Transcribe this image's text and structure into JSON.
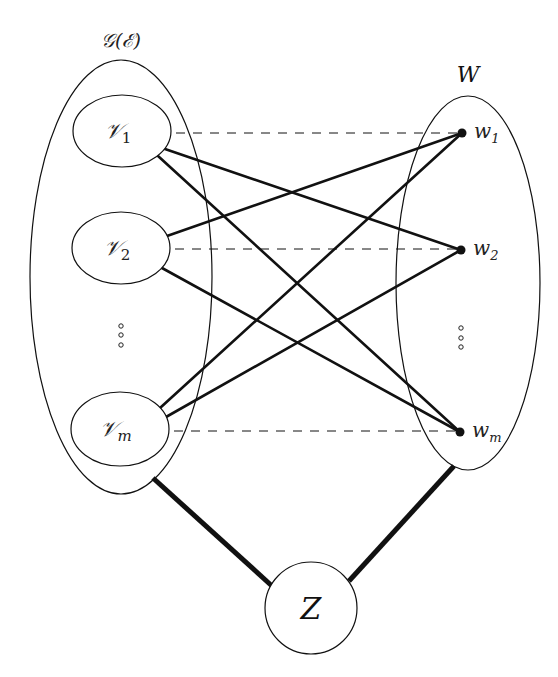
{
  "figure": {
    "width": 558,
    "height": 677,
    "colors": {
      "background": "#ffffff",
      "stroke": "#111111"
    }
  },
  "labels": {
    "left_set": "𝒢(ℰ)",
    "right_set": "W",
    "hub": "Z"
  },
  "left_group": {
    "label": "𝒢(ℰ)",
    "ellipse": {
      "cx": 121,
      "cy": 277,
      "rx": 91,
      "ry": 217
    },
    "nodes": [
      {
        "id": "v1",
        "symbol": "𝒱",
        "subscript": "1",
        "cx": 122,
        "cy": 131,
        "rx": 49,
        "ry": 36
      },
      {
        "id": "v2",
        "symbol": "𝒱",
        "subscript": "2",
        "cx": 121,
        "cy": 248,
        "rx": 49,
        "ry": 36
      },
      {
        "id": "vm",
        "symbol": "𝒱",
        "subscript": "m",
        "cx": 120,
        "cy": 429,
        "rx": 49,
        "ry": 37
      }
    ],
    "ellipsis": "⋮"
  },
  "right_group": {
    "label": "W",
    "ellipse": {
      "cx": 468,
      "cy": 283,
      "rx": 72,
      "ry": 187
    },
    "nodes": [
      {
        "id": "w1",
        "symbol": "w",
        "subscript": "1",
        "x": 462,
        "y": 133
      },
      {
        "id": "w2",
        "symbol": "w",
        "subscript": "2",
        "x": 461,
        "y": 250
      },
      {
        "id": "wm",
        "symbol": "w",
        "subscript": "m",
        "x": 460,
        "y": 432
      }
    ],
    "ellipsis": "⋮"
  },
  "hub": {
    "label": "Z",
    "cx": 311,
    "cy": 608,
    "r": 46
  },
  "edges": {
    "dashed": [
      {
        "from": "v1",
        "to": "w1",
        "x1": 176,
        "y1": 133,
        "x2": 458,
        "y2": 133
      },
      {
        "from": "v2",
        "to": "w2",
        "x1": 175,
        "y1": 249,
        "x2": 457,
        "y2": 249
      },
      {
        "from": "vm",
        "to": "wm",
        "x1": 174,
        "y1": 431,
        "x2": 456,
        "y2": 431
      }
    ],
    "solid": [
      {
        "from": "v1",
        "to": "w2",
        "x1": 165,
        "y1": 149,
        "x2": 461,
        "y2": 250
      },
      {
        "from": "v1",
        "to": "wm",
        "x1": 158,
        "y1": 156,
        "x2": 460,
        "y2": 432
      },
      {
        "from": "v2",
        "to": "w1",
        "x1": 167,
        "y1": 236,
        "x2": 462,
        "y2": 133
      },
      {
        "from": "v2",
        "to": "wm",
        "x1": 162,
        "y1": 268,
        "x2": 460,
        "y2": 432
      },
      {
        "from": "vm",
        "to": "w1",
        "x1": 160,
        "y1": 408,
        "x2": 462,
        "y2": 133
      },
      {
        "from": "vm",
        "to": "w2",
        "x1": 166,
        "y1": 417,
        "x2": 461,
        "y2": 250
      }
    ],
    "thick": [
      {
        "from": "left_group",
        "to": "hub",
        "x1": 153,
        "y1": 478,
        "x2": 272,
        "y2": 586
      },
      {
        "from": "hub",
        "to": "right_group",
        "x1": 349,
        "y1": 581,
        "x2": 454,
        "y2": 466
      }
    ]
  }
}
